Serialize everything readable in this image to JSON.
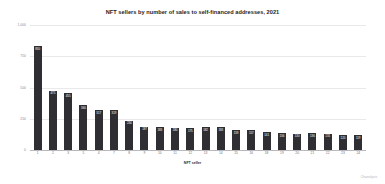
{
  "chart_data": {
    "type": "bar",
    "title": "NFT sellers by number of sales to self-financed addresses, 2021",
    "xlabel": "NFT seller",
    "ylabel": "",
    "ylim": [
      0,
      1000
    ],
    "yticks": [
      "0",
      "250",
      "500",
      "750",
      "1,000"
    ],
    "grid": true,
    "legend": false,
    "categories": [
      "1",
      "2",
      "3",
      "5",
      "4",
      "7",
      "8",
      "9",
      "10",
      "11",
      "12",
      "13",
      "14",
      "15",
      "16",
      "18",
      "19",
      "20",
      "21",
      "22",
      "23",
      "24"
    ],
    "values": [
      830,
      475,
      455,
      360,
      317,
      319,
      234,
      187,
      183,
      180,
      175,
      182,
      183,
      159,
      157,
      141,
      136,
      130,
      136,
      131,
      120,
      119
    ],
    "value_labels": [
      "830",
      "475",
      "455",
      "360",
      "317",
      "319",
      "234",
      "187",
      "183",
      "180",
      "175",
      "182",
      "183",
      "159",
      "157",
      "141",
      "136",
      "130",
      "136",
      "131",
      "120",
      "119"
    ],
    "bar_color": "#2f2f33",
    "attribution": "Chainalysis"
  }
}
